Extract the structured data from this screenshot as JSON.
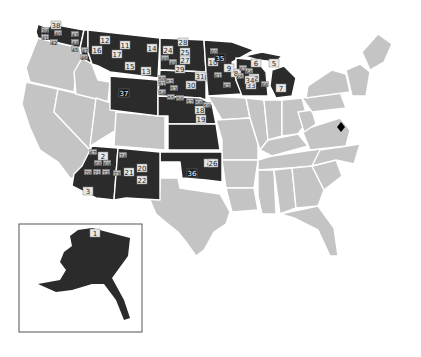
{
  "map": {
    "title": "",
    "colors": {
      "highlighted": "#2b2b2b",
      "other": "#c4c4c4",
      "border": "#ffffff",
      "background": "#ffffff",
      "inset_border": "#555555"
    },
    "legend": "none",
    "marker": {
      "name": "diamond-marker",
      "state": "Virginia",
      "x": 341,
      "y": 127
    },
    "inset": {
      "label": "Alaska",
      "box": [
        19,
        224,
        123,
        108
      ]
    },
    "highlighted_states": [
      "Washington",
      "Montana",
      "Idaho (north)",
      "Wyoming",
      "North Dakota",
      "South Dakota",
      "Nebraska",
      "Kansas",
      "Oklahoma",
      "Minnesota",
      "Wisconsin",
      "Michigan",
      "Arizona",
      "New Mexico",
      "Alaska"
    ],
    "labels": [
      {
        "text": "1",
        "x": 95,
        "y": 233,
        "style": "normal"
      },
      {
        "text": "2",
        "x": 103,
        "y": 156,
        "style": "normal"
      },
      {
        "text": "3",
        "x": 88,
        "y": 191,
        "style": "normal"
      },
      {
        "text": "4",
        "x": 209,
        "y": 163,
        "style": "normal"
      },
      {
        "text": "5",
        "x": 274,
        "y": 63,
        "style": "normal"
      },
      {
        "text": "6",
        "x": 256,
        "y": 63,
        "style": "normal"
      },
      {
        "text": "7",
        "x": 281,
        "y": 88,
        "style": "normal"
      },
      {
        "text": "8",
        "x": 236,
        "y": 73,
        "style": "normal"
      },
      {
        "text": "9",
        "x": 229,
        "y": 68,
        "style": "normal"
      },
      {
        "text": "10",
        "x": 213,
        "y": 62,
        "style": "normal"
      },
      {
        "text": "11",
        "x": 125,
        "y": 45,
        "style": "normal"
      },
      {
        "text": "12",
        "x": 105,
        "y": 40,
        "style": "normal"
      },
      {
        "text": "13",
        "x": 146,
        "y": 71,
        "style": "normal"
      },
      {
        "text": "14",
        "x": 152,
        "y": 48,
        "style": "normal"
      },
      {
        "text": "15",
        "x": 130,
        "y": 66,
        "style": "normal"
      },
      {
        "text": "16",
        "x": 97,
        "y": 50,
        "style": "normal"
      },
      {
        "text": "17",
        "x": 117,
        "y": 54,
        "style": "normal"
      },
      {
        "text": "18",
        "x": 200,
        "y": 110,
        "style": "normal"
      },
      {
        "text": "19",
        "x": 201,
        "y": 119,
        "style": "normal"
      },
      {
        "text": "20",
        "x": 142,
        "y": 168,
        "style": "normal"
      },
      {
        "text": "21",
        "x": 129,
        "y": 172,
        "style": "normal"
      },
      {
        "text": "22",
        "x": 142,
        "y": 180,
        "style": "normal"
      },
      {
        "text": "23",
        "x": 202,
        "y": 77,
        "style": "normal"
      },
      {
        "text": "24",
        "x": 168,
        "y": 50,
        "style": "normal"
      },
      {
        "text": "25",
        "x": 185,
        "y": 52,
        "style": "normal"
      },
      {
        "text": "26",
        "x": 213,
        "y": 163,
        "style": "normal"
      },
      {
        "text": "27",
        "x": 185,
        "y": 60,
        "style": "normal"
      },
      {
        "text": "28",
        "x": 183,
        "y": 42,
        "style": "normal"
      },
      {
        "text": "29",
        "x": 180,
        "y": 69,
        "style": "normal"
      },
      {
        "text": "30",
        "x": 191,
        "y": 85,
        "style": "normal"
      },
      {
        "text": "31",
        "x": 200,
        "y": 76,
        "style": "normal"
      },
      {
        "text": "32",
        "x": 254,
        "y": 78,
        "style": "normal"
      },
      {
        "text": "33",
        "x": 251,
        "y": 85,
        "style": "normal"
      },
      {
        "text": "34",
        "x": 250,
        "y": 80,
        "style": "normal"
      },
      {
        "text": "35",
        "x": 220,
        "y": 58,
        "style": "dark"
      },
      {
        "text": "36",
        "x": 192,
        "y": 173,
        "style": "dark"
      },
      {
        "text": "37",
        "x": 124,
        "y": 93,
        "style": "dark"
      },
      {
        "text": "38",
        "x": 56,
        "y": 25,
        "style": "normal"
      }
    ],
    "small_labels": [
      {
        "text": "39",
        "x": 45,
        "y": 30
      },
      {
        "text": "40",
        "x": 58,
        "y": 33
      },
      {
        "text": "41",
        "x": 45,
        "y": 37
      },
      {
        "text": "42",
        "x": 54,
        "y": 42
      },
      {
        "text": "43",
        "x": 75,
        "y": 34
      },
      {
        "text": "44",
        "x": 75,
        "y": 42
      },
      {
        "text": "45",
        "x": 75,
        "y": 49
      },
      {
        "text": "46",
        "x": 84,
        "y": 57
      },
      {
        "text": "47",
        "x": 85,
        "y": 50
      },
      {
        "text": "48",
        "x": 165,
        "y": 58
      },
      {
        "text": "49",
        "x": 173,
        "y": 62
      },
      {
        "text": "50",
        "x": 162,
        "y": 78
      },
      {
        "text": "51",
        "x": 162,
        "y": 83
      },
      {
        "text": "52",
        "x": 170,
        "y": 81
      },
      {
        "text": "53",
        "x": 174,
        "y": 88
      },
      {
        "text": "54",
        "x": 162,
        "y": 92
      },
      {
        "text": "55",
        "x": 171,
        "y": 97
      },
      {
        "text": "56",
        "x": 180,
        "y": 98
      },
      {
        "text": "57",
        "x": 190,
        "y": 101
      },
      {
        "text": "58",
        "x": 199,
        "y": 102
      },
      {
        "text": "59",
        "x": 207,
        "y": 105
      },
      {
        "text": "60",
        "x": 214,
        "y": 51
      },
      {
        "text": "61",
        "x": 218,
        "y": 75
      },
      {
        "text": "62",
        "x": 227,
        "y": 85
      },
      {
        "text": "63",
        "x": 243,
        "y": 68
      },
      {
        "text": "64",
        "x": 249,
        "y": 71
      },
      {
        "text": "65",
        "x": 240,
        "y": 76
      },
      {
        "text": "66",
        "x": 265,
        "y": 84
      },
      {
        "text": "67",
        "x": 93,
        "y": 152
      },
      {
        "text": "68",
        "x": 98,
        "y": 163
      },
      {
        "text": "69",
        "x": 107,
        "y": 163
      },
      {
        "text": "70",
        "x": 88,
        "y": 172
      },
      {
        "text": "71",
        "x": 97,
        "y": 172
      },
      {
        "text": "72",
        "x": 106,
        "y": 172
      },
      {
        "text": "73",
        "x": 117,
        "y": 173
      },
      {
        "text": "74",
        "x": 123,
        "y": 155
      }
    ]
  }
}
